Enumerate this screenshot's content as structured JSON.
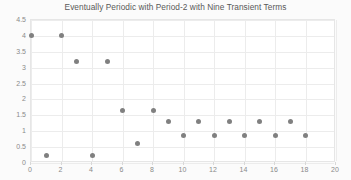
{
  "chart_data": {
    "type": "scatter",
    "title": "Eventually Periodic with Period-2 with Nine Transient Terms",
    "xlabel": "",
    "ylabel": "",
    "xlim": [
      0,
      20
    ],
    "ylim": [
      0,
      4.5
    ],
    "grid": true,
    "legend": null,
    "marker_color": "#808080",
    "x": [
      0,
      1,
      2,
      3,
      4,
      5,
      6,
      7,
      8,
      9,
      10,
      11,
      12,
      13,
      14,
      15,
      16,
      17,
      18
    ],
    "values": [
      4,
      0.25,
      4,
      3.2,
      0.25,
      3.2,
      1.65,
      0.6,
      1.65,
      1.3,
      0.85,
      1.3,
      0.85,
      1.3,
      0.85,
      1.3,
      0.85,
      1.3,
      0.85
    ],
    "xticks": [
      0,
      2,
      4,
      6,
      8,
      10,
      12,
      14,
      16,
      18,
      20
    ],
    "xtick_labels": [
      "0",
      "2",
      "4",
      "6",
      "8",
      "10",
      "12",
      "14",
      "16",
      "18",
      "20"
    ],
    "yticks": [
      0,
      0.5,
      1,
      1.5,
      2,
      2.5,
      3,
      3.5,
      4,
      4.5
    ],
    "ytick_labels": [
      "0",
      "0.5",
      "1",
      "1.5",
      "2",
      "2.5",
      "3",
      "3.5",
      "4",
      "4.5"
    ]
  },
  "colors": {
    "figure_background": "#fbfbfb",
    "plot_background": "#ffffff",
    "grid": "#ececec",
    "axis_text": "#8a8a8a",
    "title_text": "#595959"
  }
}
